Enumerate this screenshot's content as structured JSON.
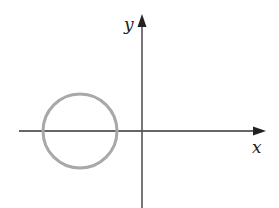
{
  "diagram": {
    "type": "coordinate-plane",
    "x_axis_label": "x",
    "y_axis_label": "y",
    "shape": "circle",
    "circle_description": "circle centered on the negative x-axis, not containing the origin",
    "colors": {
      "axes": "#333333",
      "circle": "#a8a8a8",
      "background": "#ffffff"
    }
  }
}
